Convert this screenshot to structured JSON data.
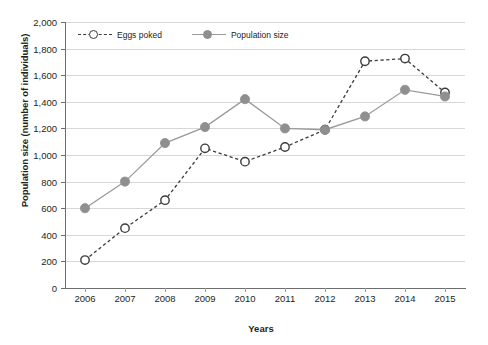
{
  "chart_data": {
    "type": "line",
    "title": "",
    "xlabel": "Years",
    "ylabel": "Population size (number of individuals)",
    "categories": [
      "2006",
      "2007",
      "2008",
      "2009",
      "2010",
      "2011",
      "2012",
      "2013",
      "2014",
      "2015"
    ],
    "ylim": [
      0,
      2000
    ],
    "ytick_step": 200,
    "ytick_labels": [
      "0",
      "200",
      "400",
      "600",
      "800",
      "1,000",
      "1,200",
      "1,400",
      "1,600",
      "1,800",
      "2,000"
    ],
    "grid": true,
    "legend_position": "top-left-inside",
    "series": [
      {
        "name": "Eggs poked",
        "style": "dashed",
        "marker": "open-circle",
        "color": "#3b3b3b",
        "values": [
          210,
          450,
          660,
          1050,
          950,
          1060,
          1190,
          1705,
          1725,
          1470
        ]
      },
      {
        "name": "Population size",
        "style": "solid",
        "marker": "filled-circle",
        "color": "#8f8f8f",
        "values": [
          600,
          800,
          1090,
          1210,
          1420,
          1200,
          1190,
          1290,
          1490,
          1440
        ]
      }
    ]
  },
  "axes": {
    "x_title": "Years",
    "y_title": "Population size (number of individuals)"
  },
  "legend": {
    "items": [
      {
        "label": "Eggs poked"
      },
      {
        "label": "Population size"
      }
    ]
  },
  "colors": {
    "eggs_line": "#3b3b3b",
    "population_line": "#9a9a9a",
    "population_marker": "#8f8f8f",
    "grid": "#d7d7d7",
    "axis": "#6d6d6d",
    "text": "#231f20"
  },
  "caption": {
    "text": ""
  }
}
